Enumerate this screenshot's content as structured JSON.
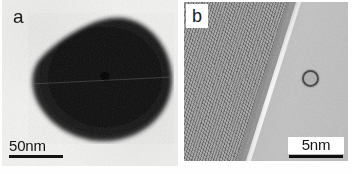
{
  "figure": {
    "type": "tem-micrograph-figure",
    "panel_count": 2,
    "background_color": "#ffffff"
  },
  "panels": [
    {
      "id": "a",
      "label": "a",
      "modality": "TEM bright-field",
      "description": "Dark teardrop-shaped nanoparticle on light amorphous support",
      "scalebar": {
        "label": "50nm",
        "value": 50,
        "unit": "nm",
        "bar_color": "#141414",
        "position": "bottom-left"
      },
      "background_color": "#f3f3f2",
      "particle_color": "#0d0d0d"
    },
    {
      "id": "b",
      "label": "b",
      "modality": "HRTEM lattice image",
      "description": "High-resolution lattice fringes with diagonal particle edge and small circular surface feature",
      "scalebar": {
        "label": "5nm",
        "value": 5,
        "unit": "nm",
        "bar_color": "#0e0e0e",
        "position": "bottom-right"
      },
      "background_color": "#8d8d8d",
      "crystal_color": "#848484",
      "vacuum_color": "#b4b4b4",
      "features": [
        {
          "name": "lattice-fringes",
          "orientation": "diagonal"
        },
        {
          "name": "particle-edge-interface",
          "orientation": "diagonal"
        },
        {
          "name": "circular-surface-feature",
          "shape": "ring"
        }
      ]
    }
  ]
}
